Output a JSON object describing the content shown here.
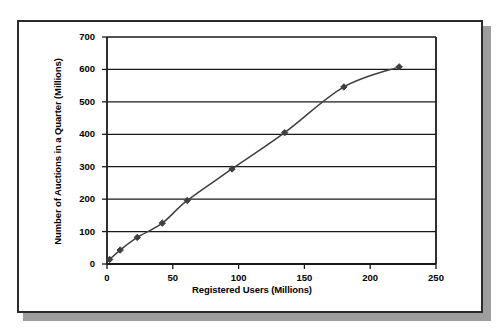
{
  "chart_data": {
    "type": "line",
    "title": "",
    "xlabel": "Registered Users (Millions)",
    "ylabel": "Number of Auctions in a Quarter (Millions)",
    "xlim": [
      0,
      250
    ],
    "ylim": [
      0,
      700
    ],
    "xticks": [
      0,
      50,
      100,
      150,
      200,
      250
    ],
    "yticks": [
      0,
      100,
      200,
      300,
      400,
      500,
      600,
      700
    ],
    "xtick_labels": [
      "0",
      "50",
      "100",
      "150",
      "200",
      "250"
    ],
    "ytick_labels": [
      "0",
      "100",
      "200",
      "300",
      "400",
      "500",
      "600",
      "700"
    ],
    "grid": "horizontal",
    "legend": "none",
    "marker": "diamond",
    "series": [
      {
        "name": "Auctions vs Registered Users",
        "color": "#3f3f3f",
        "x": [
          2,
          10,
          23,
          42,
          61,
          95,
          135,
          180,
          222
        ],
        "y": [
          14,
          43,
          82,
          126,
          196,
          293,
          405,
          546,
          608
        ]
      }
    ]
  }
}
